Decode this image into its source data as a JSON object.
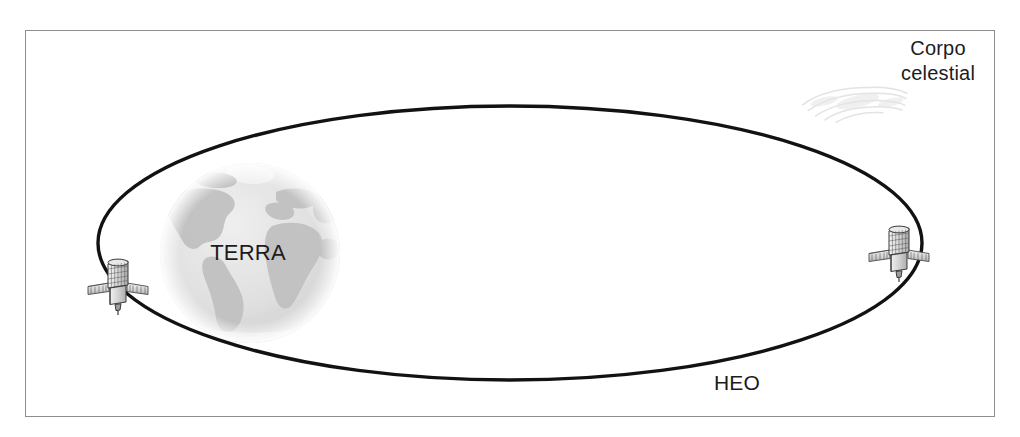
{
  "figure": {
    "frame": {
      "x": 25,
      "y": 30,
      "width": 970,
      "height": 387,
      "border_color": "#8d8d8d",
      "background": "#ffffff"
    }
  },
  "labels": {
    "celestial_body": "Corpo\ncelestial",
    "earth": "TERRA",
    "orbit": "HEO"
  },
  "colors": {
    "orbit_stroke": "#121212",
    "frame_border": "#8d8d8d",
    "text": "#1c1c1c",
    "earth_ocean": "#e4e4e4",
    "earth_land": "#b9b9b9",
    "satellite_body": "#d6d6d6",
    "satellite_outline": "#3a3a3a",
    "smudge": "#d8d8d8"
  },
  "orbit": {
    "shape": "ellipse",
    "center_x": 510,
    "center_y": 243,
    "radius_x": 412,
    "radius_y": 137,
    "stroke_width": 3.4
  },
  "earth": {
    "center_x": 250,
    "center_y": 253,
    "radius": 90,
    "label": "TERRA"
  },
  "satellites": [
    {
      "name": "satellite-left",
      "x": 118,
      "y": 288,
      "rotation": 0
    },
    {
      "name": "satellite-right",
      "x": 899,
      "y": 255,
      "rotation": 0
    }
  ],
  "artifacts": [
    {
      "name": "scan-smudge",
      "x": 800,
      "y": 70,
      "width": 110,
      "height": 60
    }
  ]
}
